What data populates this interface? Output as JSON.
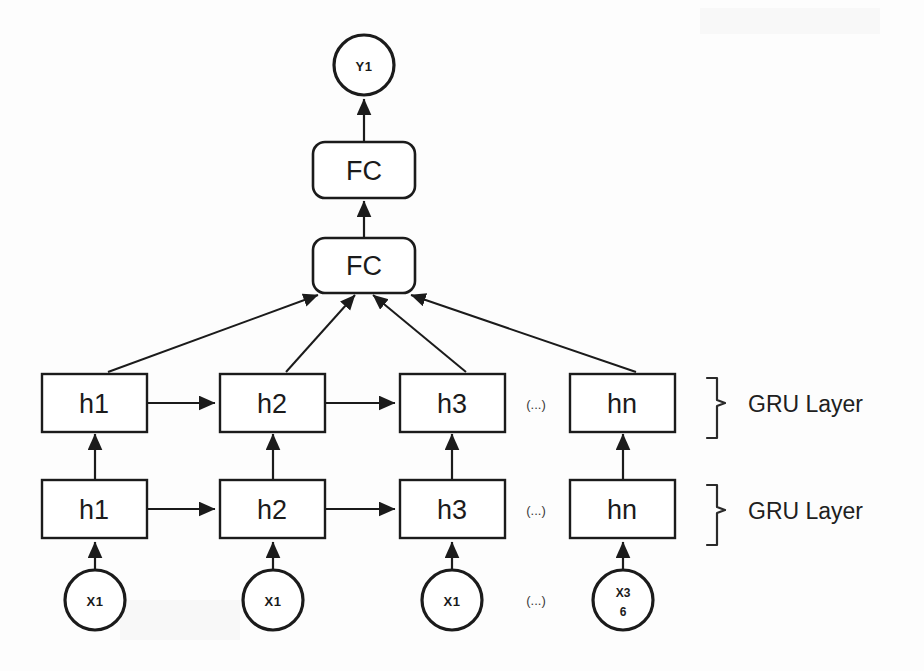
{
  "diagram": {
    "background_color": "#fdfdfd",
    "stroke_color": "#1b1b1b",
    "fill_color": "#ffffff",
    "output": {
      "label": "Y1",
      "shape": "circle"
    },
    "dense_layers": [
      {
        "label": "FC",
        "shape": "rounded-rect",
        "position": "top"
      },
      {
        "label": "FC",
        "shape": "rounded-rect",
        "position": "bottom"
      }
    ],
    "gru_layers": [
      {
        "bracket_label": "GRU Layer",
        "position": "upper",
        "cells": [
          {
            "label": "h1"
          },
          {
            "label": "h2"
          },
          {
            "label": "h3"
          },
          {
            "label": "hn"
          }
        ],
        "ellipsis": "(...)"
      },
      {
        "bracket_label": "GRU Layer",
        "position": "lower",
        "cells": [
          {
            "label": "h1"
          },
          {
            "label": "h2"
          },
          {
            "label": "h3"
          },
          {
            "label": "hn"
          }
        ],
        "ellipsis": "(...)"
      }
    ],
    "inputs": {
      "ellipsis": "(...)",
      "nodes": [
        {
          "label": "X1",
          "lines": [
            "X1"
          ]
        },
        {
          "label": "X1",
          "lines": [
            "X1"
          ]
        },
        {
          "label": "X1",
          "lines": [
            "X1"
          ]
        },
        {
          "label": "X36",
          "lines": [
            "X3",
            "6"
          ]
        }
      ]
    }
  }
}
